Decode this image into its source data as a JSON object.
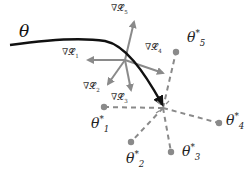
{
  "diagram": {
    "colors": {
      "trajectory": "#111111",
      "gradient_arrows": "#8a8a8a",
      "dashed_lines": "#8a8a8a",
      "target_dots": "#8a8a8a",
      "background": "#ffffff"
    },
    "trajectory": {
      "label": "θ"
    },
    "gradients": [
      {
        "symbol": "∇𝓛",
        "index": "1"
      },
      {
        "symbol": "∇𝓛",
        "index": "2"
      },
      {
        "symbol": "∇𝓛",
        "index": "3"
      },
      {
        "symbol": "∇𝓛",
        "index": "4"
      },
      {
        "symbol": "∇𝓛",
        "index": "5"
      }
    ],
    "targets": [
      {
        "symbol": "θ",
        "sup": "*",
        "index": "1"
      },
      {
        "symbol": "θ",
        "sup": "*",
        "index": "2"
      },
      {
        "symbol": "θ",
        "sup": "*",
        "index": "3"
      },
      {
        "symbol": "θ",
        "sup": "*",
        "index": "4"
      },
      {
        "symbol": "θ",
        "sup": "*",
        "index": "5"
      }
    ]
  }
}
